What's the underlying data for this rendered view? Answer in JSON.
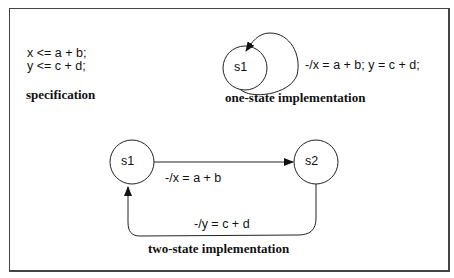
{
  "specification": {
    "lines": [
      "x <= a + b;",
      "y <= c + d;"
    ],
    "caption": "specification"
  },
  "one_state": {
    "state": "s1",
    "transition_label": "-/x = a + b; y = c + d;",
    "caption": "one-state implementation"
  },
  "two_state": {
    "states": [
      "s1",
      "s2"
    ],
    "transitions": [
      {
        "from": "s1",
        "to": "s2",
        "label": "-/x = a + b"
      },
      {
        "from": "s2",
        "to": "s1",
        "label": "-/y = c + d"
      }
    ],
    "caption": "two-state implementation"
  }
}
